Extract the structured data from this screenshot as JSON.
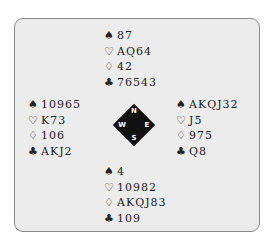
{
  "diagram": {
    "type": "bridge-deal",
    "suit_symbols": {
      "spades": "♠",
      "hearts": "♡",
      "diamonds": "♢",
      "clubs": "♣"
    },
    "compass": {
      "north": "N",
      "west": "W",
      "east": "E",
      "south": "S"
    },
    "hands": {
      "north": {
        "spades": "87",
        "hearts": "AQ64",
        "diamonds": "42",
        "clubs": "76543"
      },
      "west": {
        "spades": "10965",
        "hearts": "K73",
        "diamonds": "106",
        "clubs": "AKJ2"
      },
      "east": {
        "spades": "AKQJ32",
        "hearts": "J5",
        "diamonds": "975",
        "clubs": "Q8"
      },
      "south": {
        "spades": "4",
        "hearts": "10982",
        "diamonds": "AKQJ83",
        "clubs": "109"
      }
    }
  }
}
